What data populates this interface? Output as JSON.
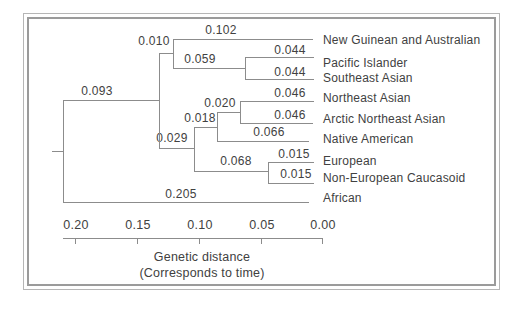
{
  "figure": {
    "background": "#ffffff",
    "line_color": "#8c8c8c",
    "text_color": "#414141",
    "frame_outer_color": "#b6b6b6",
    "frame_inner_color": "#9b9b9b"
  },
  "chart_data": {
    "type": "dendrogram",
    "orientation": "horizontal-right-to-left",
    "newick": "(((New Guinean and Australian:0.102,(Pacific Islander:0.044,Southeast Asian:0.044):0.059):0.010,(((Northeast Asian:0.046,Arctic Northeast Asian:0.046):0.020,Native American:0.066):0.018,(European:0.015,Non-European Caucasoid:0.015):0.068):0.029):0.093,African:0.205);",
    "tips": [
      {
        "name": "New Guinean and Australian",
        "value": "0.102",
        "line": {
          "x1": 173,
          "x2": 313,
          "y": 39
        },
        "label": {
          "cx": 221,
          "cy": 30
        },
        "name_y": 40
      },
      {
        "name": "Pacific Islander",
        "value": "0.044",
        "line": {
          "x1": 245,
          "x2": 314,
          "y": 57
        },
        "label": {
          "cx": 290,
          "cy": 50
        },
        "name_y": 63
      },
      {
        "name": "Southeast Asian",
        "value": "0.044",
        "line": {
          "x1": 245,
          "x2": 314,
          "y": 79
        },
        "label": {
          "cx": 290,
          "cy": 72
        },
        "name_y": 78
      },
      {
        "name": "Northeast Asian",
        "value": "0.046",
        "line": {
          "x1": 240,
          "x2": 314,
          "y": 101
        },
        "label": {
          "cx": 290,
          "cy": 93
        },
        "name_y": 98
      },
      {
        "name": "Arctic Northeast Asian",
        "value": "0.046",
        "line": {
          "x1": 240,
          "x2": 313,
          "y": 123
        },
        "label": {
          "cx": 290,
          "cy": 115
        },
        "name_y": 119
      },
      {
        "name": "Native American",
        "value": "0.066",
        "line": {
          "x1": 217,
          "x2": 309,
          "y": 141
        },
        "label": {
          "cx": 269,
          "cy": 132
        },
        "name_y": 139
      },
      {
        "name": "European",
        "value": "0.015",
        "line": {
          "x1": 268,
          "x2": 314,
          "y": 162
        },
        "label": {
          "cx": 294,
          "cy": 154
        },
        "name_y": 161
      },
      {
        "name": "Non-European Caucasoid",
        "value": "0.015",
        "line": {
          "x1": 268,
          "x2": 314,
          "y": 183
        },
        "label": {
          "cx": 296,
          "cy": 174
        },
        "name_y": 178
      },
      {
        "name": "African",
        "value": "0.205",
        "line": {
          "x1": 63,
          "x2": 309,
          "y": 202
        },
        "label": {
          "cx": 181,
          "cy": 194
        },
        "name_y": 198
      }
    ],
    "internal_branches": [
      {
        "value": "0.010",
        "line": {
          "x1": 159,
          "x2": 173,
          "y": 53
        },
        "label": {
          "cx": 154,
          "cy": 41
        }
      },
      {
        "value": "0.059",
        "line": {
          "x1": 173,
          "x2": 245,
          "y": 68
        },
        "label": {
          "cx": 200,
          "cy": 59
        }
      },
      {
        "value": "0.020",
        "line": {
          "x1": 217,
          "x2": 240,
          "y": 112
        },
        "label": {
          "cx": 220,
          "cy": 103
        }
      },
      {
        "value": "0.018",
        "line": {
          "x1": 194,
          "x2": 217,
          "y": 127
        },
        "label": {
          "cx": 200,
          "cy": 118
        }
      },
      {
        "value": "0.068",
        "line": {
          "x1": 194,
          "x2": 268,
          "y": 171
        },
        "label": {
          "cx": 236,
          "cy": 161
        }
      },
      {
        "value": "0.029",
        "line": {
          "x1": 159,
          "x2": 194,
          "y": 148
        },
        "label": {
          "cx": 172,
          "cy": 138
        }
      },
      {
        "value": "0.093",
        "line": {
          "x1": 63,
          "x2": 159,
          "y": 100
        },
        "label": {
          "cx": 97,
          "cy": 91
        }
      }
    ],
    "node_connectors": [
      {
        "x": 63,
        "y1": 100,
        "y2": 202
      },
      {
        "x": 159,
        "y1": 53,
        "y2": 148
      },
      {
        "x": 173,
        "y1": 39,
        "y2": 68
      },
      {
        "x": 245,
        "y1": 57,
        "y2": 79
      },
      {
        "x": 240,
        "y1": 101,
        "y2": 123
      },
      {
        "x": 217,
        "y1": 112,
        "y2": 141
      },
      {
        "x": 194,
        "y1": 127,
        "y2": 171
      },
      {
        "x": 268,
        "y1": 162,
        "y2": 183
      }
    ],
    "root_stub": {
      "x1": 52,
      "x2": 63,
      "y": 151
    },
    "tip_label_x": 323,
    "axis": {
      "title_line1": "Genetic distance",
      "title_line2": "(Corresponds to time)",
      "min": 0.0,
      "max": 0.2,
      "reversed": true,
      "line": {
        "x1": 63,
        "x2": 323,
        "y": 238
      },
      "ticks": [
        {
          "label": "0.20",
          "x": 75
        },
        {
          "label": "0.15",
          "x": 137
        },
        {
          "label": "0.10",
          "x": 199
        },
        {
          "label": "0.05",
          "x": 261
        },
        {
          "label": "0.00",
          "x": 322
        }
      ],
      "tick_label_cy": 225,
      "caption_cx": 202,
      "caption1_cy": 257,
      "caption2_cy": 273
    }
  }
}
